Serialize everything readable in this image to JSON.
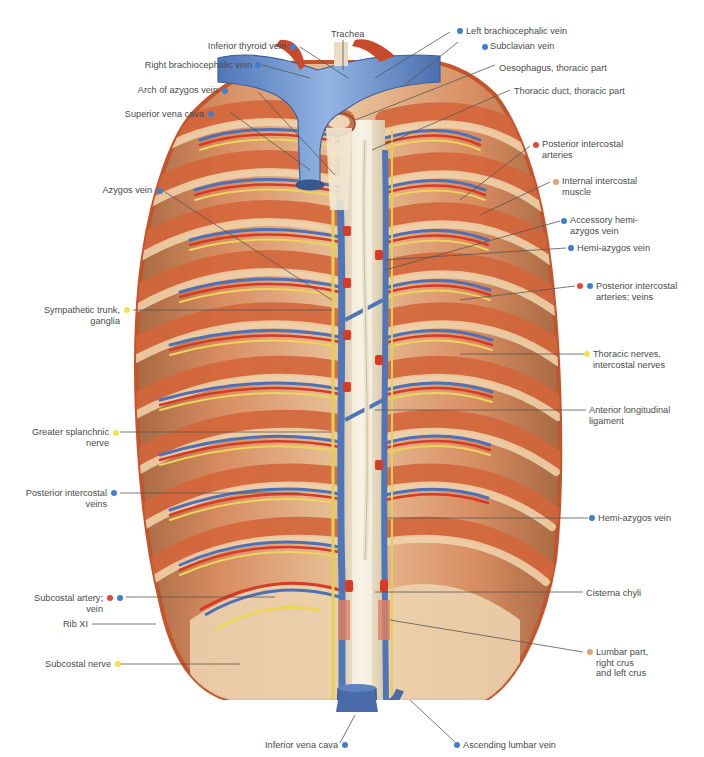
{
  "figure": {
    "marker_colors": {
      "vein": "#3f7fd0",
      "artery": "#e24a35",
      "nerve": "#f0e44a",
      "muscle": "#e8a06e"
    }
  },
  "labels_top": [
    {
      "id": "inferior-thyroid-vein",
      "text": "Inferior thyroid vein",
      "marker": [
        "vein"
      ]
    },
    {
      "id": "trachea",
      "text": "Trachea",
      "marker": []
    },
    {
      "id": "left-brachiocephalic-vein",
      "text": "Left brachiocephalic vein",
      "marker": [
        "vein"
      ]
    }
  ],
  "labels_left": [
    {
      "id": "right-brachiocephalic-vein",
      "lines": [
        "Right brachiocephalic vein"
      ],
      "marker": [
        "vein"
      ]
    },
    {
      "id": "arch-of-azygos-vein",
      "lines": [
        "Arch of azygos vein"
      ],
      "marker": [
        "vein"
      ]
    },
    {
      "id": "superior-vena-cava",
      "lines": [
        "Superior vena cava"
      ],
      "marker": [
        "vein"
      ]
    },
    {
      "id": "azygos-vein",
      "lines": [
        "Azygos vein"
      ],
      "marker": [
        "vein"
      ]
    },
    {
      "id": "sympathetic-trunk",
      "lines": [
        "Sympathetic trunk,",
        "ganglia"
      ],
      "marker": [
        "nerve"
      ]
    },
    {
      "id": "greater-splanchnic-nerve",
      "lines": [
        "Greater splanchnic",
        "nerve"
      ],
      "marker": [
        "nerve"
      ]
    },
    {
      "id": "posterior-intercostal-veins",
      "lines": [
        "Posterior intercostal",
        "veins"
      ],
      "marker": [
        "vein"
      ]
    },
    {
      "id": "subcostal-artery-vein",
      "lines": [
        "Subcostal artery;",
        "vein"
      ],
      "marker": [
        "artery",
        "vein"
      ]
    },
    {
      "id": "rib-xi",
      "lines": [
        "Rib XI"
      ],
      "marker": []
    },
    {
      "id": "subcostal-nerve",
      "lines": [
        "Subcostal nerve"
      ],
      "marker": [
        "nerve"
      ]
    }
  ],
  "labels_right": [
    {
      "id": "subclavian-vein",
      "lines": [
        "Subclavian vein"
      ],
      "marker": [
        "vein"
      ]
    },
    {
      "id": "oesophagus",
      "lines": [
        "Oesophagus, thoracic part"
      ],
      "marker": []
    },
    {
      "id": "thoracic-duct",
      "lines": [
        "Thoracic duct, thoracic part"
      ],
      "marker": []
    },
    {
      "id": "posterior-intercostal-arteries",
      "lines": [
        "Posterior intercostal",
        "arteries"
      ],
      "marker": [
        "artery"
      ]
    },
    {
      "id": "internal-intercostal-muscle",
      "lines": [
        "Internal intercostal",
        "muscle"
      ],
      "marker": [
        "muscle"
      ]
    },
    {
      "id": "accessory-hemiazygos-vein",
      "lines": [
        "Accessory hemi-",
        "azygos vein"
      ],
      "marker": [
        "vein"
      ]
    },
    {
      "id": "hemiazygos-vein-upper",
      "lines": [
        "Hemi-azygos vein"
      ],
      "marker": [
        "vein"
      ]
    },
    {
      "id": "posterior-intercostal-arteries-veins",
      "lines": [
        "Posterior intercostal",
        "arteries; veins"
      ],
      "marker": [
        "artery",
        "vein"
      ]
    },
    {
      "id": "thoracic-nerves",
      "lines": [
        "Thoracic nerves,",
        "intercostal nerves"
      ],
      "marker": [
        "nerve"
      ]
    },
    {
      "id": "anterior-longitudinal-ligament",
      "lines": [
        "Anterior longitudinal",
        "ligament"
      ],
      "marker": []
    },
    {
      "id": "hemiazygos-vein-lower",
      "lines": [
        "Hemi-azygos vein"
      ],
      "marker": [
        "vein"
      ]
    },
    {
      "id": "cisterna-chyli",
      "lines": [
        "Cisterna chyli"
      ],
      "marker": []
    },
    {
      "id": "lumbar-part-crus",
      "lines": [
        "Lumbar part,",
        "right crus",
        "and left crus"
      ],
      "marker": [
        "muscle"
      ]
    }
  ],
  "labels_bottom": [
    {
      "id": "inferior-vena-cava",
      "text": "Inferior vena cava",
      "marker": [
        "vein"
      ]
    },
    {
      "id": "ascending-lumbar-vein",
      "text": "Ascending lumbar vein",
      "marker": [
        "vein"
      ]
    }
  ]
}
